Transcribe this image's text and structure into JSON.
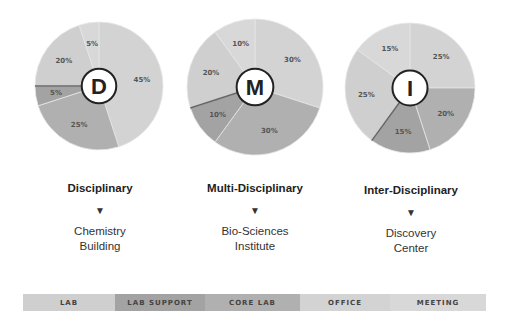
{
  "chart_data": {
    "type": "pie",
    "title": "",
    "legend": {
      "position": "bottom",
      "entries": [
        {
          "name": "LAB",
          "color": "#cfcfcf"
        },
        {
          "name": "LAB SUPPORT",
          "color": "#a3a3a3"
        },
        {
          "name": "CORE LAB",
          "color": "#b0b0b0"
        },
        {
          "name": "OFFICE",
          "color": "#d3d3d3"
        },
        {
          "name": "MEETING",
          "color": "#d8d8d8"
        }
      ]
    },
    "charts": [
      {
        "center_label": "D",
        "category": "Disciplinary",
        "example": "Chemistry Building",
        "slices": [
          {
            "name": "OFFICE",
            "value": 45,
            "label": "45%"
          },
          {
            "name": "CORE LAB",
            "value": 25,
            "label": "25%"
          },
          {
            "name": "LAB SUPPORT",
            "value": 5,
            "label": "5%"
          },
          {
            "name": "LAB",
            "value": 20,
            "label": "20%"
          },
          {
            "name": "MEETING",
            "value": 5,
            "label": "5%"
          }
        ]
      },
      {
        "center_label": "M",
        "category": "Multi-Disciplinary",
        "example": "Bio-Sciences Institute",
        "slices": [
          {
            "name": "OFFICE",
            "value": 30,
            "label": "30%"
          },
          {
            "name": "CORE LAB",
            "value": 30,
            "label": "30%"
          },
          {
            "name": "LAB SUPPORT",
            "value": 10,
            "label": "10%"
          },
          {
            "name": "LAB",
            "value": 20,
            "label": "20%"
          },
          {
            "name": "MEETING",
            "value": 10,
            "label": "10%"
          }
        ]
      },
      {
        "center_label": "I",
        "category": "Inter-Disciplinary",
        "example": "Discovery Center",
        "slices": [
          {
            "name": "OFFICE",
            "value": 25,
            "label": "25%"
          },
          {
            "name": "CORE LAB",
            "value": 20,
            "label": "20%"
          },
          {
            "name": "LAB SUPPORT",
            "value": 15,
            "label": "15%"
          },
          {
            "name": "LAB",
            "value": 25,
            "label": "25%"
          },
          {
            "name": "MEETING",
            "value": 15,
            "label": "15%"
          }
        ]
      }
    ]
  },
  "columns": [
    {
      "title": "Disciplinary",
      "arrow": "▼",
      "building_line1": "Chemistry",
      "building_line2": "Building"
    },
    {
      "title": "Multi-Disciplinary",
      "arrow": "▼",
      "building_line1": "Bio-Sciences",
      "building_line2": "Institute"
    },
    {
      "title": "Inter-Disciplinary",
      "arrow": "▼",
      "building_line1": "Discovery",
      "building_line2": "Center"
    }
  ],
  "legend_bar": [
    {
      "label": "LAB",
      "color": "#cfcfcf",
      "width": 92
    },
    {
      "label": "LAB SUPPORT",
      "color": "#a3a3a3",
      "width": 90
    },
    {
      "label": "CORE LAB",
      "color": "#b0b0b0",
      "width": 95
    },
    {
      "label": "OFFICE",
      "color": "#d3d3d3",
      "width": 90
    },
    {
      "label": "MEETING",
      "color": "#d8d8d8",
      "width": 96
    }
  ]
}
